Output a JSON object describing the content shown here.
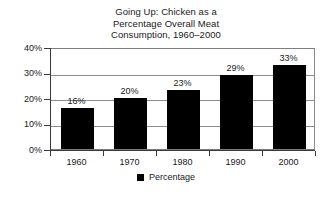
{
  "chart_data": {
    "type": "bar",
    "title": "Going Up: Chicken as a Percentage Overall Meat Consumption, 1960–2000",
    "title_lines": [
      "Going Up: Chicken as a",
      "Percentage Overall Meat",
      "Consumption, 1960–2000"
    ],
    "categories": [
      "1960",
      "1970",
      "1980",
      "1990",
      "2000"
    ],
    "values": [
      16,
      20,
      23,
      29,
      33
    ],
    "value_labels": [
      "16%",
      "20%",
      "23%",
      "29%",
      "33%"
    ],
    "series": [
      {
        "name": "Percentage",
        "values": [
          16,
          20,
          23,
          29,
          33
        ],
        "color": "#000000"
      }
    ],
    "xlabel": "",
    "ylabel": "",
    "ylim": [
      0,
      40
    ],
    "ytick_values": [
      0,
      10,
      20,
      30,
      40
    ],
    "ytick_labels": [
      "0%",
      "10%",
      "20%",
      "30%",
      "40%"
    ],
    "grid": true,
    "grid_axis": "y",
    "legend_position": "bottom",
    "legend_entries": [
      {
        "label": "Percentage",
        "color": "#000000",
        "swatch": "filled-square"
      }
    ],
    "bar_color": "#000000",
    "gridline_color": "#8c8c8c",
    "axis_color": "#3a3a3a",
    "background_color": "#ffffff"
  }
}
